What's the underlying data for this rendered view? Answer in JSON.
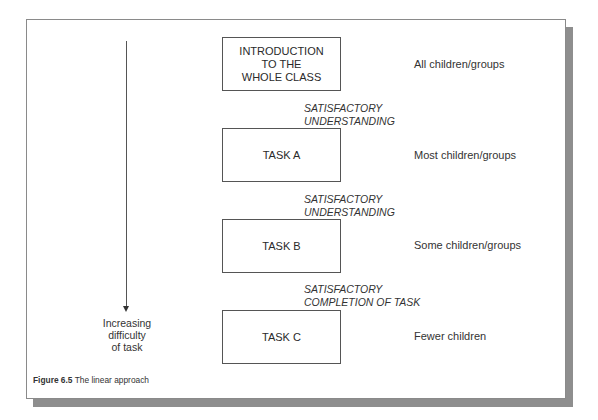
{
  "figure": {
    "caption_number": "Figure 6.5",
    "caption_title": "The linear approach"
  },
  "axis": {
    "label": "Increasing\ndifficulty\nof task",
    "direction": "down"
  },
  "stages": [
    {
      "box": "INTRODUCTION\nTO THE\nWHOLE CLASS",
      "audience": "All children/groups"
    },
    {
      "box": "TASK A",
      "audience": "Most children/groups"
    },
    {
      "box": "TASK B",
      "audience": "Some children/groups"
    },
    {
      "box": "TASK C",
      "audience": "Fewer children"
    }
  ],
  "transitions": [
    "SATISFACTORY\nUNDERSTANDING",
    "SATISFACTORY\nUNDERSTANDING",
    "SATISFACTORY\nCOMPLETION OF TASK"
  ]
}
